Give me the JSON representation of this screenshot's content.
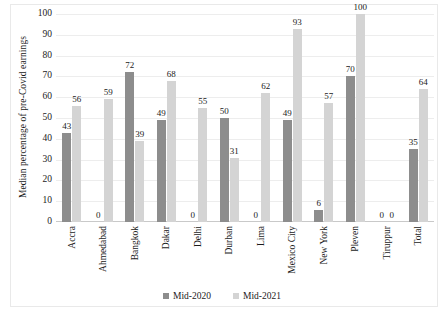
{
  "chart_data": {
    "type": "bar",
    "title": "",
    "subtitle": "",
    "xlabel": "",
    "ylabel": "Median percentage of pre-Covid earnings",
    "ylim": [
      0,
      100
    ],
    "ytick_step": 10,
    "yticks": [
      100,
      90,
      80,
      70,
      60,
      50,
      40,
      30,
      20,
      10,
      0
    ],
    "grid": true,
    "legend_position": "bottom",
    "categories": [
      "Accra",
      "Ahmedabad",
      "Bangkok",
      "Dakar",
      "Delhi",
      "Durban",
      "Lima",
      "Mexico City",
      "New York",
      "Pleven",
      "Tiruppur",
      "Total"
    ],
    "series": [
      {
        "name": "Mid-2020",
        "color": "#8d8d8d",
        "values": [
          43,
          0,
          72,
          49,
          0,
          50,
          0,
          49,
          6,
          70,
          0,
          35
        ]
      },
      {
        "name": "Mid-2021",
        "color": "#d4d4d4",
        "values": [
          56,
          59,
          39,
          68,
          55,
          31,
          62,
          93,
          57,
          100,
          0,
          64
        ]
      }
    ]
  },
  "legend": {
    "items": [
      {
        "label": "Mid-2020"
      },
      {
        "label": "Mid-2021"
      }
    ]
  }
}
